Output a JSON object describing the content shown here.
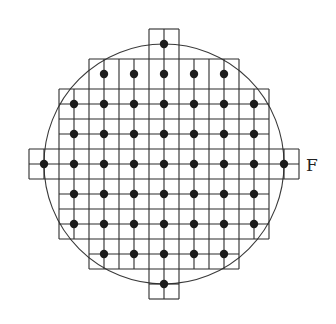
{
  "figure": {
    "label": "F",
    "colors": {
      "line": "#2b2b2b",
      "dot": "#1c1c1c",
      "background": "#ffffff"
    }
  },
  "geometry": {
    "origin": 29,
    "spacing": 15,
    "circle": {
      "cx": 164,
      "cy": 164,
      "r": 120
    },
    "dot_radius": 4.2,
    "h_segments": [
      {
        "y": 29,
        "x1": 149,
        "x2": 179
      },
      {
        "y": 59,
        "x1": 89,
        "x2": 239
      },
      {
        "y": 89,
        "x1": 59,
        "x2": 269
      },
      {
        "y": 104,
        "x1": 59,
        "x2": 269
      },
      {
        "y": 119,
        "x1": 59,
        "x2": 269
      },
      {
        "y": 134,
        "x1": 59,
        "x2": 269
      },
      {
        "y": 149,
        "x1": 29,
        "x2": 299
      },
      {
        "y": 164,
        "x1": 29,
        "x2": 299
      },
      {
        "y": 179,
        "x1": 29,
        "x2": 299
      },
      {
        "y": 194,
        "x1": 59,
        "x2": 269
      },
      {
        "y": 209,
        "x1": 59,
        "x2": 269
      },
      {
        "y": 224,
        "x1": 59,
        "x2": 269
      },
      {
        "y": 239,
        "x1": 59,
        "x2": 269
      },
      {
        "y": 254,
        "x1": 89,
        "x2": 239
      },
      {
        "y": 269,
        "x1": 89,
        "x2": 239
      },
      {
        "y": 284,
        "x1": 149,
        "x2": 179
      },
      {
        "y": 299,
        "x1": 149,
        "x2": 179
      }
    ],
    "v_segments": [
      {
        "x": 29,
        "y1": 149,
        "y2": 179
      },
      {
        "x": 44,
        "y1": 149,
        "y2": 179
      },
      {
        "x": 59,
        "y1": 89,
        "y2": 239
      },
      {
        "x": 74,
        "y1": 89,
        "y2": 239
      },
      {
        "x": 89,
        "y1": 59,
        "y2": 269
      },
      {
        "x": 104,
        "y1": 59,
        "y2": 269
      },
      {
        "x": 119,
        "y1": 59,
        "y2": 269
      },
      {
        "x": 134,
        "y1": 59,
        "y2": 269
      },
      {
        "x": 149,
        "y1": 29,
        "y2": 299
      },
      {
        "x": 164,
        "y1": 29,
        "y2": 299
      },
      {
        "x": 179,
        "y1": 29,
        "y2": 299
      },
      {
        "x": 194,
        "y1": 59,
        "y2": 269
      },
      {
        "x": 209,
        "y1": 59,
        "y2": 269
      },
      {
        "x": 224,
        "y1": 59,
        "y2": 269
      },
      {
        "x": 239,
        "y1": 59,
        "y2": 269
      },
      {
        "x": 254,
        "y1": 89,
        "y2": 239
      },
      {
        "x": 269,
        "y1": 89,
        "y2": 239
      },
      {
        "x": 284,
        "y1": 149,
        "y2": 179
      },
      {
        "x": 299,
        "y1": 149,
        "y2": 179
      }
    ],
    "dot_rows": [
      {
        "y": 44,
        "xs": [
          164
        ]
      },
      {
        "y": 74,
        "xs": [
          104,
          134,
          164,
          194,
          224
        ]
      },
      {
        "y": 104,
        "xs": [
          74,
          104,
          134,
          164,
          194,
          224,
          254
        ]
      },
      {
        "y": 134,
        "xs": [
          74,
          104,
          134,
          164,
          194,
          224,
          254
        ]
      },
      {
        "y": 164,
        "xs": [
          44,
          74,
          104,
          134,
          164,
          194,
          224,
          254,
          284
        ]
      },
      {
        "y": 194,
        "xs": [
          74,
          104,
          134,
          164,
          194,
          224,
          254
        ]
      },
      {
        "y": 224,
        "xs": [
          74,
          104,
          134,
          164,
          194,
          224,
          254
        ]
      },
      {
        "y": 254,
        "xs": [
          104,
          134,
          164,
          194,
          224
        ]
      },
      {
        "y": 284,
        "xs": [
          164
        ]
      }
    ],
    "label_pos": {
      "x": 306,
      "y": 171
    }
  }
}
